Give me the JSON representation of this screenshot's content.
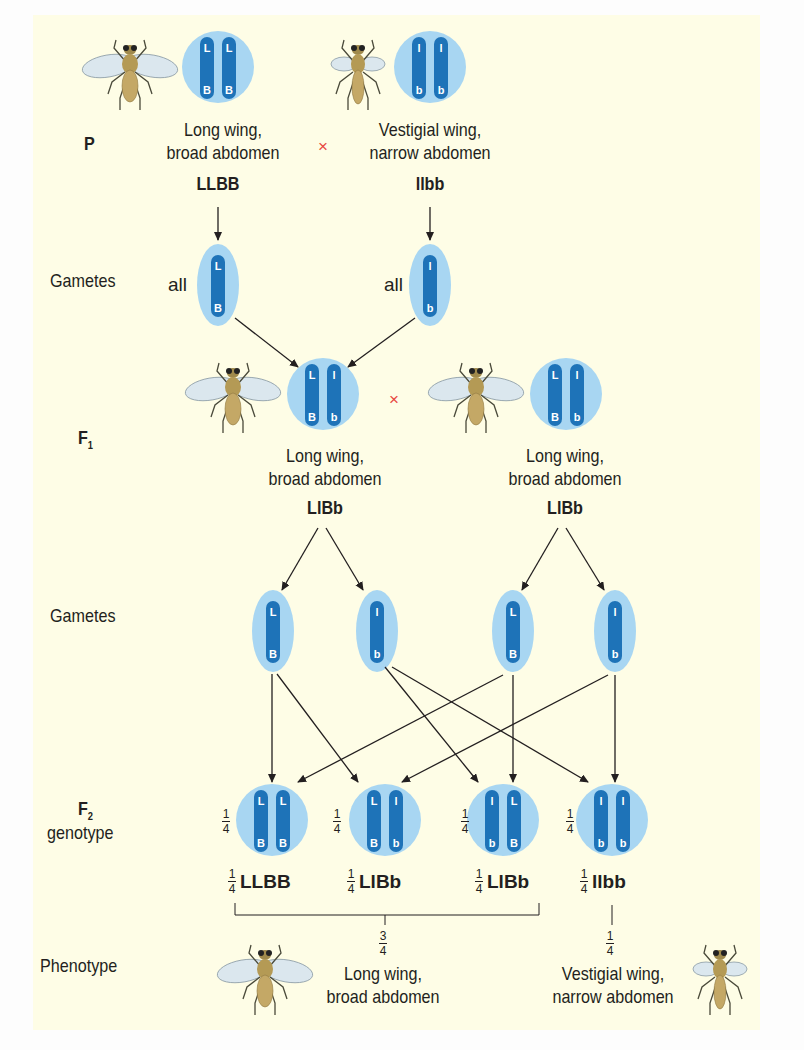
{
  "colors": {
    "background": "#fefde6",
    "chromosome": "#1e73b8",
    "nucleus": "#a8d6f2",
    "text": "#231f20",
    "cross": "#e8483f",
    "arrow": "#231f20"
  },
  "rows": {
    "p": "P",
    "gametes1": "Gametes",
    "f1": "F",
    "f1_sub": "1",
    "gametes2": "Gametes",
    "f2": "F",
    "f2_sub": "2",
    "f2_genotype": "genotype",
    "phenotype": "Phenotype"
  },
  "cross_symbol": "×",
  "parents": [
    {
      "desc1": "Long wing,",
      "desc2": "broad abdomen",
      "genotype": "LLBB",
      "chromosomes": [
        [
          "L",
          "B"
        ],
        [
          "L",
          "B"
        ]
      ],
      "fly": "long-wing"
    },
    {
      "desc1": "Vestigial wing,",
      "desc2": "narrow abdomen",
      "genotype": "llbb",
      "chromosomes": [
        [
          "l",
          "b"
        ],
        [
          "l",
          "b"
        ]
      ],
      "fly": "vestigial-wing"
    }
  ],
  "gametes_p": [
    {
      "prefix": "all",
      "alleles": [
        "L",
        "B"
      ]
    },
    {
      "prefix": "all",
      "alleles": [
        "l",
        "b"
      ]
    }
  ],
  "f1": [
    {
      "desc1": "Long wing,",
      "desc2": "broad abdomen",
      "genotype": "LlBb",
      "chromosomes": [
        [
          "L",
          "B"
        ],
        [
          "l",
          "b"
        ]
      ]
    },
    {
      "desc1": "Long wing,",
      "desc2": "broad abdomen",
      "genotype": "LlBb",
      "chromosomes": [
        [
          "L",
          "B"
        ],
        [
          "l",
          "b"
        ]
      ]
    }
  ],
  "gametes_f1": [
    [
      "L",
      "B"
    ],
    [
      "l",
      "b"
    ],
    [
      "L",
      "B"
    ],
    [
      "l",
      "b"
    ]
  ],
  "f2": [
    {
      "fraction_num": "1",
      "fraction_den": "4",
      "genotype": "LLBB",
      "chromosomes": [
        [
          "L",
          "B"
        ],
        [
          "L",
          "B"
        ]
      ]
    },
    {
      "fraction_num": "1",
      "fraction_den": "4",
      "genotype": "LlBb",
      "chromosomes": [
        [
          "L",
          "B"
        ],
        [
          "l",
          "b"
        ]
      ]
    },
    {
      "fraction_num": "1",
      "fraction_den": "4",
      "genotype": "LlBb",
      "chromosomes": [
        [
          "l",
          "b"
        ],
        [
          "L",
          "B"
        ]
      ]
    },
    {
      "fraction_num": "1",
      "fraction_den": "4",
      "genotype": "llbb",
      "chromosomes": [
        [
          "l",
          "b"
        ],
        [
          "l",
          "b"
        ]
      ]
    }
  ],
  "phenotypes": [
    {
      "fraction_num": "3",
      "fraction_den": "4",
      "desc1": "Long wing,",
      "desc2": "broad abdomen"
    },
    {
      "fraction_num": "1",
      "fraction_den": "4",
      "desc1": "Vestigial wing,",
      "desc2": "narrow abdomen"
    }
  ]
}
